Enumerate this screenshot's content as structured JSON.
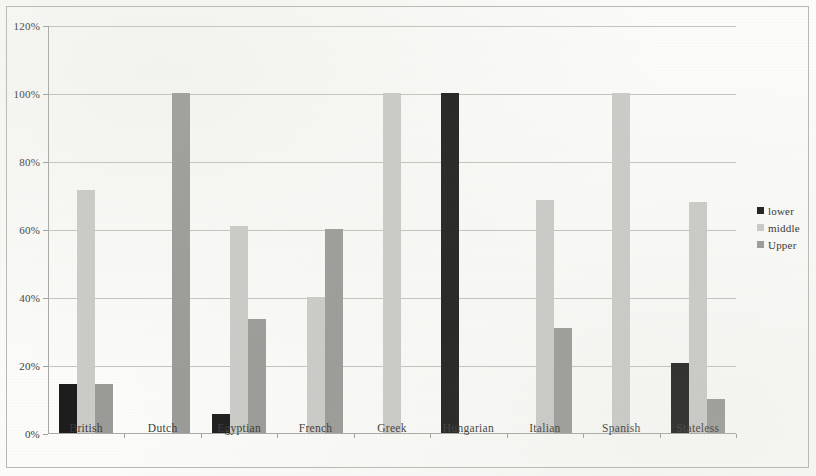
{
  "chart_data": {
    "type": "bar",
    "title": "",
    "xlabel": "",
    "ylabel": "",
    "ylim": [
      0,
      120
    ],
    "ytick_labels": [
      "0%",
      "20%",
      "40%",
      "60%",
      "80%",
      "100%",
      "120%"
    ],
    "ytick_values": [
      0,
      20,
      40,
      60,
      80,
      100,
      120
    ],
    "grid": true,
    "legend_position": "right",
    "categories": [
      "British",
      "Dutch",
      "Egyptian",
      "French",
      "Greek",
      "Hungarian",
      "Italian",
      "Spanish",
      "Stateless"
    ],
    "series": [
      {
        "name": "lower",
        "color": "#1c1c1c",
        "values": [
          14.5,
          0,
          5.5,
          0,
          0,
          100,
          0,
          0,
          20.5
        ]
      },
      {
        "name": "middle",
        "color": "#cbcbc8",
        "values": [
          71.5,
          0,
          61,
          40,
          100,
          0,
          68.5,
          100,
          68
        ]
      },
      {
        "name": "Upper",
        "color": "#9a9a97",
        "values": [
          14.5,
          100,
          33.5,
          60,
          0,
          0,
          31,
          0,
          10
        ]
      }
    ]
  },
  "legend": {
    "items": [
      {
        "label": "lower",
        "color": "#1c1c1c"
      },
      {
        "label": "middle",
        "color": "#cbcbc8"
      },
      {
        "label": "Upper",
        "color": "#9a9a97"
      }
    ]
  }
}
